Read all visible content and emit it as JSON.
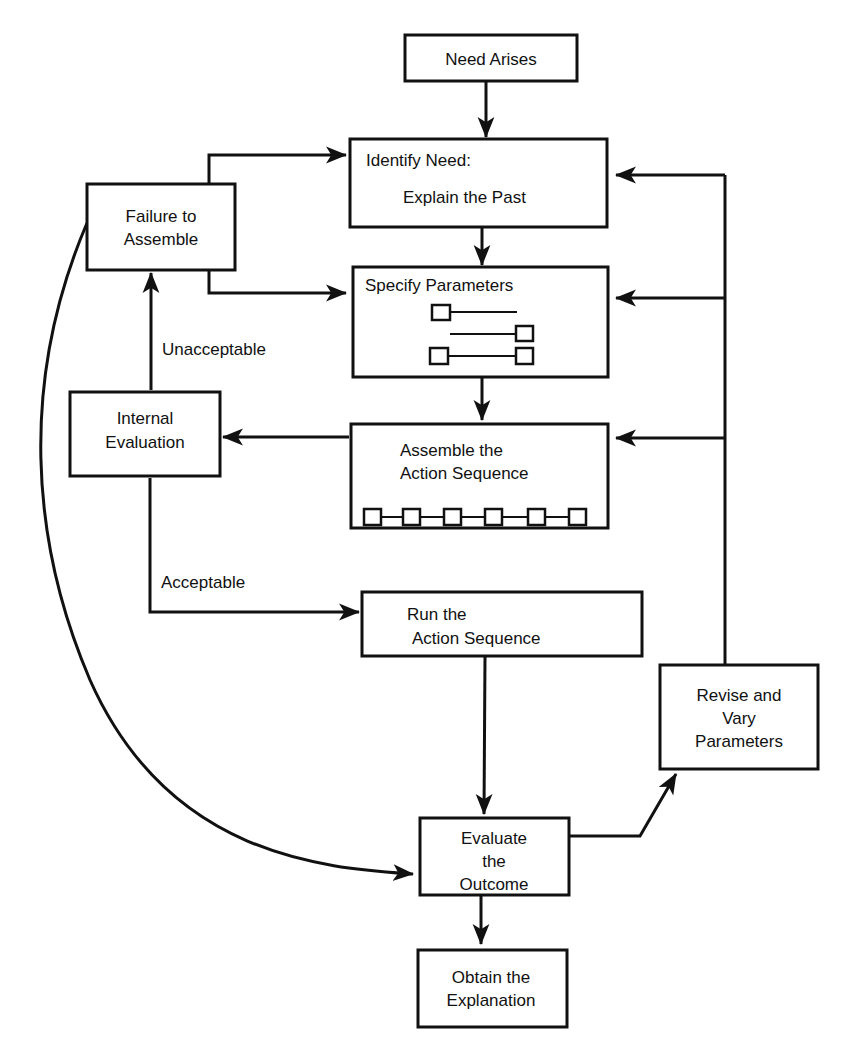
{
  "diagram": {
    "type": "flowchart",
    "nodes": {
      "need_arises": {
        "label": "Need Arises"
      },
      "identify_need": {
        "label_line1": "Identify Need:",
        "label_line2": "Explain the Past"
      },
      "specify_parameters": {
        "label": "Specify Parameters"
      },
      "assemble": {
        "label_line1": "Assemble the",
        "label_line2": "Action Sequence"
      },
      "run": {
        "label_line1": "Run the",
        "label_line2": "Action Sequence"
      },
      "evaluate": {
        "label_line1": "Evaluate",
        "label_line2": "the",
        "label_line3": "Outcome"
      },
      "obtain": {
        "label_line1": "Obtain the",
        "label_line2": "Explanation"
      },
      "failure": {
        "label_line1": "Failure to",
        "label_line2": "Assemble"
      },
      "internal_eval": {
        "label_line1": "Internal",
        "label_line2": "Evaluation"
      },
      "revise": {
        "label_line1": "Revise and",
        "label_line2": "Vary",
        "label_line3": "Parameters"
      }
    },
    "edge_labels": {
      "unacceptable": "Unacceptable",
      "acceptable": "Acceptable"
    },
    "edges": [
      {
        "from": "Need Arises",
        "to": "Identify Need"
      },
      {
        "from": "Identify Need",
        "to": "Specify Parameters"
      },
      {
        "from": "Specify Parameters",
        "to": "Assemble the Action Sequence"
      },
      {
        "from": "Assemble the Action Sequence",
        "to": "Internal Evaluation"
      },
      {
        "from": "Internal Evaluation",
        "to": "Failure to Assemble",
        "label": "Unacceptable"
      },
      {
        "from": "Internal Evaluation",
        "to": "Run the Action Sequence",
        "label": "Acceptable"
      },
      {
        "from": "Failure to Assemble",
        "to": "Identify Need"
      },
      {
        "from": "Failure to Assemble",
        "to": "Specify Parameters"
      },
      {
        "from": "Failure to Assemble",
        "to": "Evaluate the Outcome"
      },
      {
        "from": "Run the Action Sequence",
        "to": "Evaluate the Outcome"
      },
      {
        "from": "Evaluate the Outcome",
        "to": "Revise and Vary Parameters"
      },
      {
        "from": "Evaluate the Outcome",
        "to": "Obtain the Explanation"
      },
      {
        "from": "Revise and Vary Parameters",
        "to": "Identify Need"
      },
      {
        "from": "Revise and Vary Parameters",
        "to": "Specify Parameters"
      },
      {
        "from": "Revise and Vary Parameters",
        "to": "Assemble the Action Sequence"
      }
    ]
  }
}
